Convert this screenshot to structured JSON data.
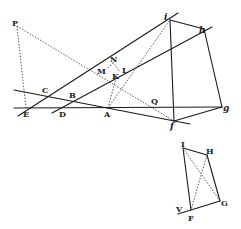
{
  "figure_main": {
    "labels": {
      "P": "P",
      "i": "i",
      "h": "h",
      "g": "g",
      "f": "f",
      "E": "E",
      "D": "D",
      "A": "A",
      "C": "C",
      "B": "B",
      "M": "M",
      "N": "N",
      "K": "K",
      "L": "L",
      "Q": "Q"
    }
  },
  "figure_small": {
    "labels": {
      "I": "I",
      "H": "H",
      "G": "G",
      "F": "F",
      "V": "V"
    }
  }
}
